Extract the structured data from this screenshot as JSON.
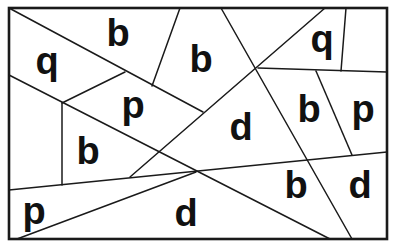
{
  "puzzle": {
    "title": "",
    "frame": {
      "x": 9,
      "y": 8,
      "width": 378,
      "height": 231
    },
    "line_color": "#1a1a1a",
    "letter_color": "#111111",
    "lines": [
      {
        "x1": 9,
        "y1": 8,
        "x2": 203,
        "y2": 112
      },
      {
        "x1": 130,
        "y1": 177,
        "x2": 325,
        "y2": 8
      },
      {
        "x1": 221,
        "y1": 8,
        "x2": 352,
        "y2": 239
      },
      {
        "x1": 258,
        "y1": 68,
        "x2": 387,
        "y2": 72
      },
      {
        "x1": 346,
        "y1": 8,
        "x2": 341,
        "y2": 71
      },
      {
        "x1": 316,
        "y1": 71,
        "x2": 352,
        "y2": 155
      },
      {
        "x1": 9,
        "y1": 75,
        "x2": 330,
        "y2": 239
      },
      {
        "x1": 62,
        "y1": 103,
        "x2": 125,
        "y2": 72
      },
      {
        "x1": 152,
        "y1": 86,
        "x2": 180,
        "y2": 8
      },
      {
        "x1": 62,
        "y1": 103,
        "x2": 62,
        "y2": 185
      },
      {
        "x1": 9,
        "y1": 190,
        "x2": 387,
        "y2": 152
      },
      {
        "x1": 17,
        "y1": 239,
        "x2": 196,
        "y2": 172
      }
    ],
    "letters": [
      {
        "char": "q",
        "x": 47,
        "y": 74
      },
      {
        "char": "b",
        "x": 118,
        "y": 46
      },
      {
        "char": "b",
        "x": 201,
        "y": 72
      },
      {
        "char": "q",
        "x": 322,
        "y": 52
      },
      {
        "char": "p",
        "x": 133,
        "y": 118
      },
      {
        "char": "d",
        "x": 241,
        "y": 140
      },
      {
        "char": "b",
        "x": 309,
        "y": 122
      },
      {
        "char": "p",
        "x": 363,
        "y": 122
      },
      {
        "char": "b",
        "x": 88,
        "y": 164
      },
      {
        "char": "p",
        "x": 34,
        "y": 224
      },
      {
        "char": "d",
        "x": 186,
        "y": 226
      },
      {
        "char": "b",
        "x": 296,
        "y": 198
      },
      {
        "char": "d",
        "x": 360,
        "y": 198
      }
    ]
  }
}
